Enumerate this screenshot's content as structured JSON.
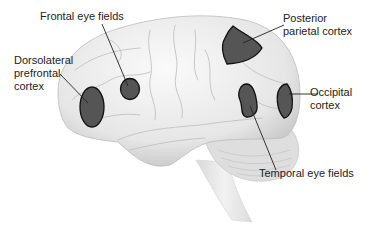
{
  "diagram": {
    "colors": {
      "background": "#ffffff",
      "brain_fill": "#eeeeee",
      "brain_shadow": "#c8c8c8",
      "region_fill": "#555555",
      "region_stroke": "#111111",
      "leader_line": "#222222",
      "label_text": "#222222"
    },
    "labels": [
      {
        "id": "frontal-eye-fields",
        "text": "Frontal eye fields"
      },
      {
        "id": "dorsolateral-prefrontal-cortex",
        "text": "Dorsolateral\nprefrontal\ncortex"
      },
      {
        "id": "posterior-parietal-cortex",
        "text": "Posterior\nparietal cortex"
      },
      {
        "id": "occipital-cortex",
        "text": "Occipital\ncortex"
      },
      {
        "id": "temporal-eye-fields",
        "text": "Temporal eye fields"
      }
    ]
  }
}
